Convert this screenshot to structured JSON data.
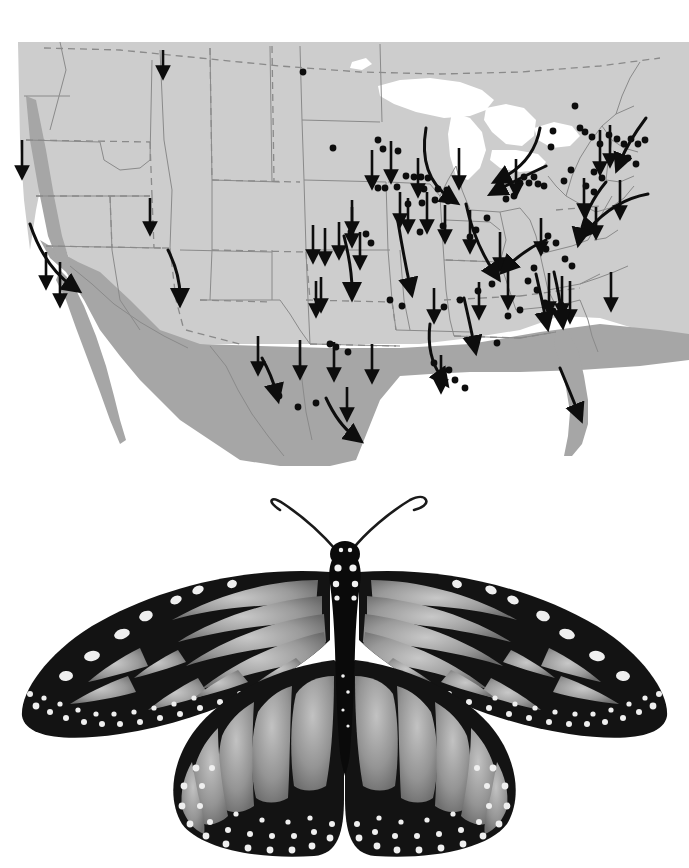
{
  "figure": {
    "kind": "composite-figure",
    "panels": [
      "migration-map",
      "butterfly-photograph"
    ],
    "caption": "",
    "background_color": "#ffffff"
  },
  "map": {
    "title": "",
    "projection_region": "North America (contiguous United States and Mexico)",
    "colors": {
      "land_light_gray": "#cdcdcd",
      "land_dark_gray": "#a6a6a6",
      "water_white": "#ffffff",
      "state_border": "#8a8a8a",
      "international_border_dashed": "#8a8a8a",
      "arrow_black": "#0d0d0d",
      "recovery_dot_black": "#0d0d0d",
      "page_background": "#ffffff"
    },
    "legend_items": [
      {
        "symbol": "arrow",
        "meaning": "fall migration direction"
      },
      {
        "symbol": "dot",
        "meaning": "tag recovery site"
      },
      {
        "symbol": "dark-gray-shading",
        "meaning": "overwintering / southern range"
      },
      {
        "symbol": "light-gray-shading",
        "meaning": "summer breeding range"
      }
    ],
    "recovery_dots": [
      [
        303,
        72
      ],
      [
        333,
        148
      ],
      [
        378,
        140
      ],
      [
        383,
        149
      ],
      [
        398,
        151
      ],
      [
        378,
        188
      ],
      [
        385,
        188
      ],
      [
        397,
        187
      ],
      [
        406,
        176
      ],
      [
        414,
        177
      ],
      [
        421,
        177
      ],
      [
        428,
        178
      ],
      [
        424,
        189
      ],
      [
        438,
        189
      ],
      [
        447,
        190
      ],
      [
        435,
        200
      ],
      [
        448,
        201
      ],
      [
        422,
        203
      ],
      [
        408,
        204
      ],
      [
        351,
        232
      ],
      [
        366,
        234
      ],
      [
        371,
        243
      ],
      [
        420,
        232
      ],
      [
        443,
        226
      ],
      [
        487,
        218
      ],
      [
        476,
        230
      ],
      [
        470,
        237
      ],
      [
        506,
        199
      ],
      [
        514,
        196
      ],
      [
        520,
        183
      ],
      [
        524,
        177
      ],
      [
        529,
        183
      ],
      [
        534,
        177
      ],
      [
        538,
        184
      ],
      [
        544,
        186
      ],
      [
        551,
        147
      ],
      [
        553,
        131
      ],
      [
        575,
        106
      ],
      [
        580,
        128
      ],
      [
        585,
        132
      ],
      [
        592,
        137
      ],
      [
        600,
        144
      ],
      [
        609,
        135
      ],
      [
        617,
        139
      ],
      [
        624,
        144
      ],
      [
        631,
        139
      ],
      [
        638,
        144
      ],
      [
        645,
        140
      ],
      [
        612,
        157
      ],
      [
        620,
        163
      ],
      [
        628,
        158
      ],
      [
        636,
        164
      ],
      [
        594,
        172
      ],
      [
        602,
        178
      ],
      [
        586,
        186
      ],
      [
        594,
        192
      ],
      [
        571,
        170
      ],
      [
        564,
        181
      ],
      [
        548,
        236
      ],
      [
        556,
        243
      ],
      [
        546,
        249
      ],
      [
        565,
        259
      ],
      [
        572,
        266
      ],
      [
        534,
        268
      ],
      [
        528,
        281
      ],
      [
        537,
        290
      ],
      [
        545,
        303
      ],
      [
        553,
        311
      ],
      [
        561,
        305
      ],
      [
        520,
        310
      ],
      [
        508,
        316
      ],
      [
        492,
        284
      ],
      [
        478,
        291
      ],
      [
        460,
        300
      ],
      [
        444,
        307
      ],
      [
        390,
        300
      ],
      [
        402,
        306
      ],
      [
        330,
        344
      ],
      [
        348,
        352
      ],
      [
        298,
        407
      ],
      [
        279,
        396
      ],
      [
        316,
        403
      ],
      [
        336,
        347
      ],
      [
        434,
        363
      ],
      [
        449,
        370
      ],
      [
        497,
        343
      ],
      [
        455,
        380
      ],
      [
        465,
        388
      ]
    ],
    "straight_arrows": [
      [
        163,
        50,
        163,
        72
      ],
      [
        22,
        140,
        22,
        172
      ],
      [
        150,
        198,
        150,
        228
      ],
      [
        46,
        252,
        46,
        282
      ],
      [
        60,
        262,
        60,
        300
      ],
      [
        313,
        225,
        313,
        256
      ],
      [
        325,
        228,
        325,
        258
      ],
      [
        339,
        222,
        339,
        252
      ],
      [
        352,
        207,
        352,
        240
      ],
      [
        360,
        232,
        360,
        262
      ],
      [
        316,
        281,
        316,
        310
      ],
      [
        321,
        277,
        321,
        305
      ],
      [
        258,
        336,
        258,
        368
      ],
      [
        300,
        340,
        300,
        372
      ],
      [
        334,
        342,
        334,
        374
      ],
      [
        372,
        344,
        372,
        376
      ],
      [
        434,
        288,
        434,
        316
      ],
      [
        352,
        200,
        352,
        228
      ],
      [
        372,
        150,
        372,
        182
      ],
      [
        391,
        141,
        391,
        176
      ],
      [
        418,
        158,
        418,
        190
      ],
      [
        427,
        192,
        427,
        226
      ],
      [
        445,
        205,
        445,
        236
      ],
      [
        459,
        148,
        459,
        182
      ],
      [
        470,
        210,
        470,
        246
      ],
      [
        479,
        282,
        479,
        312
      ],
      [
        500,
        232,
        500,
        264
      ],
      [
        508,
        271,
        508,
        302
      ],
      [
        516,
        159,
        516,
        190
      ],
      [
        541,
        218,
        541,
        248
      ],
      [
        549,
        273,
        549,
        308
      ],
      [
        562,
        276,
        562,
        310
      ],
      [
        570,
        281,
        570,
        316
      ],
      [
        584,
        178,
        584,
        210
      ],
      [
        600,
        130,
        600,
        168
      ],
      [
        610,
        125,
        610,
        160
      ],
      [
        620,
        180,
        620,
        212
      ],
      [
        596,
        207,
        596,
        232
      ],
      [
        611,
        272,
        611,
        304
      ],
      [
        347,
        387,
        347,
        414
      ],
      [
        441,
        355,
        441,
        386
      ],
      [
        400,
        192,
        400,
        220
      ],
      [
        408,
        198,
        408,
        226
      ]
    ],
    "curved_arrows": [
      "west-coast-california-hook",
      "great-lakes-michigan-sweep",
      "ontario-lake-erie-westward",
      "new-england-to-coast-sweep",
      "mid-atlantic-chesapeake-sweep",
      "appalachian-southwest-hook",
      "texas-gulf-coast-hook",
      "mississippi-delta-hook",
      "florida-peninsula-southeast",
      "rio-grande-southward",
      "carolinas-southward-sweep"
    ]
  },
  "butterfly": {
    "common_name": "monarch butterfly",
    "scientific_name": "Danaus plexippus",
    "view": "dorsal, wings spread",
    "rendering": "black and white photograph",
    "features": [
      "paired clubbed antennae",
      "black body with white spots",
      "black wing veins",
      "pale (orange) wing cells",
      "black wing margins with double row of white spots"
    ],
    "colors": {
      "wing_black": "#111111",
      "wing_cell_light": "#b5b5b5",
      "wing_cell_mid": "#8c8c8c",
      "wing_spot_white": "#f2f2f2",
      "body_black": "#0a0a0a",
      "background": "#ffffff"
    }
  }
}
